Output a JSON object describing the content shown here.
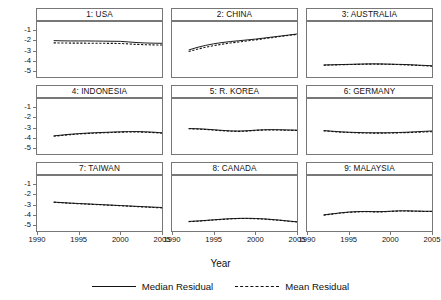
{
  "chart_data": {
    "type": "line",
    "title": "",
    "xlabel": "Year",
    "ylabel": "",
    "xlim": [
      1990,
      2005
    ],
    "ylim": [
      -5.6,
      -0.2
    ],
    "xticks": [
      1990,
      1995,
      2000,
      2005
    ],
    "yticks": [
      -1,
      -2,
      -3,
      -4,
      -5
    ],
    "grid": false,
    "legend_position": "bottom",
    "legend": [
      {
        "name": "Median Residual",
        "style": "solid"
      },
      {
        "name": "Mean Residual",
        "style": "dashed"
      }
    ],
    "layout": {
      "rows": 3,
      "cols": 3
    },
    "x": [
      1992,
      1993,
      1994,
      1995,
      1996,
      1997,
      1998,
      1999,
      2000,
      2001,
      2002,
      2003,
      2004,
      2005
    ],
    "panels": [
      {
        "title": "1: USA",
        "series": [
          {
            "name": "Median Residual",
            "style": "solid",
            "values": [
              -2.03,
              -2.05,
              -2.06,
              -2.06,
              -2.06,
              -2.07,
              -2.08,
              -2.09,
              -2.1,
              -2.16,
              -2.22,
              -2.26,
              -2.28,
              -2.29
            ]
          },
          {
            "name": "Mean Residual",
            "style": "dashed",
            "values": [
              -2.25,
              -2.26,
              -2.27,
              -2.27,
              -2.28,
              -2.28,
              -2.29,
              -2.3,
              -2.31,
              -2.35,
              -2.4,
              -2.43,
              -2.45,
              -2.46
            ]
          }
        ]
      },
      {
        "title": "2: CHINA",
        "series": [
          {
            "name": "Median Residual",
            "style": "solid",
            "values": [
              -2.95,
              -2.7,
              -2.5,
              -2.34,
              -2.22,
              -2.12,
              -2.04,
              -1.96,
              -1.88,
              -1.78,
              -1.68,
              -1.58,
              -1.48,
              -1.38
            ]
          },
          {
            "name": "Mean Residual",
            "style": "dashed",
            "values": [
              -3.1,
              -2.88,
              -2.68,
              -2.52,
              -2.38,
              -2.26,
              -2.16,
              -2.06,
              -1.96,
              -1.85,
              -1.74,
              -1.63,
              -1.52,
              -1.42
            ]
          }
        ]
      },
      {
        "title": "3: AUSTRALIA",
        "series": [
          {
            "name": "Median Residual",
            "style": "solid",
            "values": [
              -4.42,
              -4.4,
              -4.38,
              -4.36,
              -4.34,
              -4.32,
              -4.31,
              -4.32,
              -4.34,
              -4.36,
              -4.38,
              -4.42,
              -4.46,
              -4.5
            ]
          },
          {
            "name": "Mean Residual",
            "style": "dashed",
            "values": [
              -4.44,
              -4.42,
              -4.4,
              -4.38,
              -4.36,
              -4.34,
              -4.33,
              -4.34,
              -4.36,
              -4.38,
              -4.41,
              -4.45,
              -4.49,
              -4.53
            ]
          }
        ]
      },
      {
        "title": "4: INDONESIA",
        "series": [
          {
            "name": "Median Residual",
            "style": "solid",
            "values": [
              -3.82,
              -3.74,
              -3.66,
              -3.6,
              -3.55,
              -3.51,
              -3.48,
              -3.45,
              -3.42,
              -3.4,
              -3.4,
              -3.42,
              -3.46,
              -3.52
            ]
          },
          {
            "name": "Mean Residual",
            "style": "dashed",
            "values": [
              -3.86,
              -3.78,
              -3.7,
              -3.64,
              -3.59,
              -3.55,
              -3.52,
              -3.49,
              -3.46,
              -3.44,
              -3.44,
              -3.46,
              -3.5,
              -3.56
            ]
          }
        ]
      },
      {
        "title": "5: R. KOREA",
        "series": [
          {
            "name": "Median Residual",
            "style": "solid",
            "values": [
              -3.1,
              -3.12,
              -3.16,
              -3.22,
              -3.28,
              -3.33,
              -3.35,
              -3.32,
              -3.26,
              -3.22,
              -3.21,
              -3.22,
              -3.24,
              -3.26
            ]
          },
          {
            "name": "Mean Residual",
            "style": "dashed",
            "values": [
              -3.12,
              -3.15,
              -3.19,
              -3.25,
              -3.31,
              -3.36,
              -3.38,
              -3.35,
              -3.29,
              -3.25,
              -3.24,
              -3.25,
              -3.27,
              -3.29
            ]
          }
        ]
      },
      {
        "title": "6: GERMANY",
        "series": [
          {
            "name": "Median Residual",
            "style": "solid",
            "values": [
              -3.3,
              -3.36,
              -3.42,
              -3.46,
              -3.49,
              -3.51,
              -3.52,
              -3.52,
              -3.51,
              -3.49,
              -3.46,
              -3.42,
              -3.38,
              -3.34
            ]
          },
          {
            "name": "Mean Residual",
            "style": "dashed",
            "values": [
              -3.33,
              -3.39,
              -3.45,
              -3.49,
              -3.52,
              -3.54,
              -3.55,
              -3.55,
              -3.54,
              -3.52,
              -3.5,
              -3.47,
              -3.44,
              -3.41
            ]
          }
        ]
      },
      {
        "title": "7: TAIWAN",
        "series": [
          {
            "name": "Median Residual",
            "style": "solid",
            "values": [
              -2.76,
              -2.81,
              -2.86,
              -2.9,
              -2.94,
              -2.98,
              -3.02,
              -3.06,
              -3.1,
              -3.14,
              -3.18,
              -3.22,
              -3.26,
              -3.29
            ]
          },
          {
            "name": "Mean Residual",
            "style": "dashed",
            "values": [
              -2.78,
              -2.83,
              -2.88,
              -2.92,
              -2.96,
              -3.0,
              -3.04,
              -3.08,
              -3.12,
              -3.16,
              -3.21,
              -3.25,
              -3.29,
              -3.33
            ]
          }
        ]
      },
      {
        "title": "8: CANADA",
        "series": [
          {
            "name": "Median Residual",
            "style": "solid",
            "values": [
              -4.66,
              -4.62,
              -4.56,
              -4.5,
              -4.44,
              -4.39,
              -4.36,
              -4.35,
              -4.37,
              -4.41,
              -4.47,
              -4.54,
              -4.62,
              -4.7
            ]
          },
          {
            "name": "Mean Residual",
            "style": "dashed",
            "values": [
              -4.68,
              -4.64,
              -4.58,
              -4.52,
              -4.46,
              -4.41,
              -4.38,
              -4.37,
              -4.39,
              -4.43,
              -4.49,
              -4.56,
              -4.64,
              -4.72
            ]
          }
        ]
      },
      {
        "title": "9: MALAYSIA",
        "series": [
          {
            "name": "Median Residual",
            "style": "solid",
            "values": [
              -4.02,
              -3.92,
              -3.82,
              -3.74,
              -3.7,
              -3.68,
              -3.7,
              -3.7,
              -3.66,
              -3.62,
              -3.62,
              -3.64,
              -3.66,
              -3.66
            ]
          },
          {
            "name": "Mean Residual",
            "style": "dashed",
            "values": [
              -4.04,
              -3.94,
              -3.84,
              -3.76,
              -3.72,
              -3.7,
              -3.72,
              -3.72,
              -3.68,
              -3.64,
              -3.64,
              -3.66,
              -3.68,
              -3.68
            ]
          }
        ]
      }
    ]
  },
  "axis": {
    "xlabel": "Year",
    "xtick_labels": [
      "1990",
      "1995",
      "2000",
      "2005"
    ],
    "ytick_labels": [
      "-1",
      "-2",
      "-3",
      "-4",
      "-5"
    ]
  },
  "legend": {
    "items": [
      {
        "label": "Median Residual",
        "style": "solid"
      },
      {
        "label": "Mean Residual",
        "style": "dashed"
      }
    ]
  },
  "colors": {
    "line": "#111111",
    "frame": "#777777",
    "background": "#ffffff"
  }
}
